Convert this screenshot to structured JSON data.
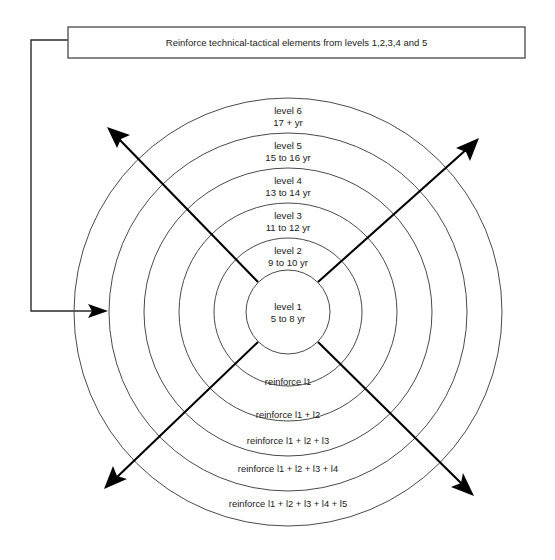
{
  "banner": {
    "text": "Reinforce technical-tactical elements from levels 1,2,3,4 and 5"
  },
  "center": {
    "level": "level 1",
    "age": "5 to 8 yr"
  },
  "rings": [
    {
      "level": "level 2",
      "age": "9 to 10 yr",
      "reinforce": "reinforce l1"
    },
    {
      "level": "level 3",
      "age": "11 to 12 yr",
      "reinforce": "reinforce l1 + l2"
    },
    {
      "level": "level 4",
      "age": "13 to 14 yr",
      "reinforce": "reinforce l1 + l2 + l3"
    },
    {
      "level": "level 5",
      "age": "15 to 16 yr",
      "reinforce": "reinforce l1 + l2 + l3 + l4"
    },
    {
      "level": "level 6",
      "age": "17 + yr",
      "reinforce": "reinforce l1 + l2 + l3 + l4 + l5"
    }
  ],
  "colors": {
    "ring_stroke": "#4a4a4a",
    "arrow": "#000000",
    "banner_stroke": "#555555",
    "text": "#1a1a1a",
    "background": "#ffffff"
  }
}
